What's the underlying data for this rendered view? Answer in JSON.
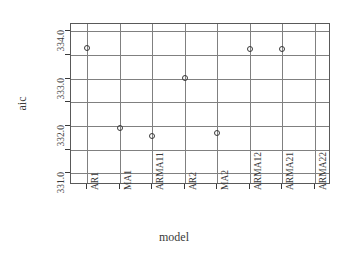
{
  "chart_data": {
    "type": "scatter",
    "title": "",
    "xlabel": "model",
    "ylabel": "aic",
    "categories": [
      "AR1",
      "MA1",
      "ARMA11",
      "AR2",
      "MA2",
      "ARMA12",
      "ARMA21",
      "ARMA22"
    ],
    "values": [
      333.65,
      331.95,
      331.78,
      333.02,
      331.85,
      333.63,
      333.63,
      null
    ],
    "x_tick_labels": [
      "AR1",
      "MA1",
      "ARMA11",
      "AR2",
      "MA2",
      "ARMA12",
      "ARMA21",
      "ARMA22"
    ],
    "y_tick_labels": [
      "334.0",
      "333.0",
      "332.0",
      "331.0"
    ],
    "y_tick_values": [
      334.0,
      333.0,
      332.0,
      331.0
    ],
    "y_minor_tick_values": [
      333.5,
      332.5,
      331.5
    ],
    "ylim": [
      330.75,
      334.15
    ],
    "grid": true,
    "legend": null,
    "marker": "open-circle",
    "marker_color": "#3a3a3a",
    "grid_color": "#808080",
    "frame_color": "#595959"
  },
  "axes": {
    "x_title": "model",
    "y_title": "aic"
  }
}
